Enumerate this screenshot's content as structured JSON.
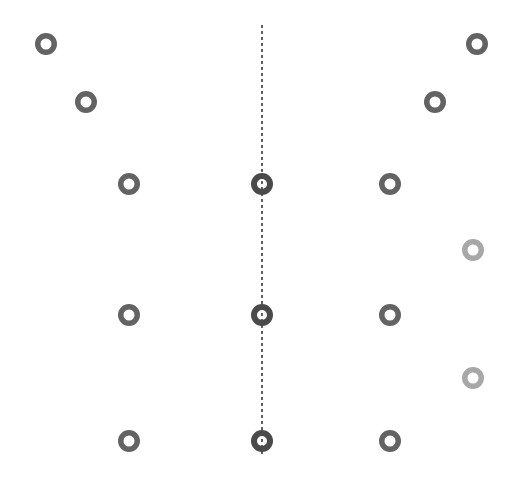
{
  "figure": {
    "width": 514,
    "height": 480,
    "background_color": "#ffffff"
  },
  "chart_data": {
    "type": "scatter",
    "title": "",
    "subtitle": "",
    "xlabel": "",
    "ylabel": "",
    "xlim": [
      0,
      514
    ],
    "ylim": [
      0,
      480
    ],
    "grid": false,
    "legend": null,
    "axes_visible": false,
    "tick_labels": [],
    "annotations": [],
    "marker_style": "open ring (annulus)",
    "symmetry_axis": {
      "name": "vertical-dashed-axis",
      "orientation": "vertical",
      "x": 262,
      "y_start": 25,
      "y_end": 455,
      "color": "#3a3a3a",
      "stroke_width": 1.6,
      "dash_pattern": "3,3",
      "style": "dashed"
    },
    "colors": {
      "dark_ring": "#636363",
      "darker_ring": "#4a4a4a",
      "light_ring": "#a8a8a8",
      "axis": "#3a3a3a",
      "background": "#ffffff"
    },
    "series": [
      {
        "name": "left-side rings",
        "color": "#636363",
        "count": 5,
        "points": [
          {
            "label": "L1",
            "x": 46,
            "y": 44,
            "r_outer": 11,
            "r_inner": 5.5,
            "color": "#636363"
          },
          {
            "label": "L2",
            "x": 86,
            "y": 102,
            "r_outer": 11,
            "r_inner": 5.5,
            "color": "#636363"
          },
          {
            "label": "L3",
            "x": 129,
            "y": 184,
            "r_outer": 11,
            "r_inner": 5.5,
            "color": "#636363"
          },
          {
            "label": "L4",
            "x": 129,
            "y": 315,
            "r_outer": 11,
            "r_inner": 5.5,
            "color": "#636363"
          },
          {
            "label": "L5",
            "x": 129,
            "y": 441,
            "r_outer": 11,
            "r_inner": 5.5,
            "color": "#636363"
          }
        ]
      },
      {
        "name": "axis rings",
        "color": "#4a4a4a",
        "count": 3,
        "points": [
          {
            "label": "C1",
            "x": 262,
            "y": 184,
            "r_outer": 11,
            "r_inner": 5.0,
            "color": "#4a4a4a"
          },
          {
            "label": "C2",
            "x": 262,
            "y": 315,
            "r_outer": 11,
            "r_inner": 5.0,
            "color": "#4a4a4a"
          },
          {
            "label": "C3",
            "x": 262,
            "y": 441,
            "r_outer": 11,
            "r_inner": 5.0,
            "color": "#4a4a4a"
          }
        ]
      },
      {
        "name": "right-side rings",
        "color": "#636363",
        "count": 5,
        "points": [
          {
            "label": "R1",
            "x": 477,
            "y": 44,
            "r_outer": 11,
            "r_inner": 5.5,
            "color": "#636363"
          },
          {
            "label": "R2",
            "x": 435,
            "y": 102,
            "r_outer": 11,
            "r_inner": 5.5,
            "color": "#636363"
          },
          {
            "label": "R3",
            "x": 390,
            "y": 184,
            "r_outer": 11,
            "r_inner": 5.5,
            "color": "#636363"
          },
          {
            "label": "R4",
            "x": 390,
            "y": 315,
            "r_outer": 11,
            "r_inner": 5.5,
            "color": "#636363"
          },
          {
            "label": "R5",
            "x": 390,
            "y": 441,
            "r_outer": 11,
            "r_inner": 5.5,
            "color": "#636363"
          }
        ]
      },
      {
        "name": "faint right rings",
        "color": "#a8a8a8",
        "count": 2,
        "points": [
          {
            "label": "F1",
            "x": 473,
            "y": 250,
            "r_outer": 11,
            "r_inner": 5.5,
            "color": "#a8a8a8"
          },
          {
            "label": "F2",
            "x": 473,
            "y": 378,
            "r_outer": 11,
            "r_inner": 5.5,
            "color": "#a8a8a8"
          }
        ]
      }
    ]
  }
}
